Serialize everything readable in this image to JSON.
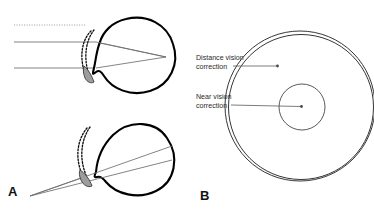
{
  "figure": {
    "background_color": "#ffffff",
    "width": 374,
    "height": 213
  },
  "panels": [
    {
      "id": "A",
      "letter": "A",
      "name": "eye-optics-panel",
      "description": "Two eye cross-sections showing distance and near vision ray paths through a contact lens"
    },
    {
      "id": "B",
      "letter": "B",
      "name": "lens-face-panel",
      "description": "Front view of a concentric bifocal contact lens"
    }
  ],
  "callouts": [
    {
      "id": "distance-vision",
      "line1": "Distance vision",
      "line2": "correction",
      "target": "outer annular zone of the contact lens"
    },
    {
      "id": "near-vision",
      "line1": "Near vision",
      "line2": "correction",
      "target": "central circular zone of the contact lens"
    }
  ],
  "colors": {
    "outline": "#000000",
    "ray": "#6e6e6e",
    "lens_fill": "#9d9d9d",
    "text": "#2a2a2a",
    "lens_circle": "#2b2b2b"
  },
  "diagram_elements": {
    "top_eye": {
      "name": "distance-vision-eye",
      "rays": "two parallel horizontal incoming rays converging at the retina",
      "lens": "contact lens shown at the cornea"
    },
    "bottom_eye": {
      "name": "near-vision-eye",
      "rays": "two diverging rays from a near point converging at the retina",
      "lens": "contact lens shown at the cornea"
    },
    "lens_face": {
      "name": "bifocal-lens-front-view",
      "outer_zone": "distance vision correction",
      "inner_zone": "near vision correction"
    }
  }
}
